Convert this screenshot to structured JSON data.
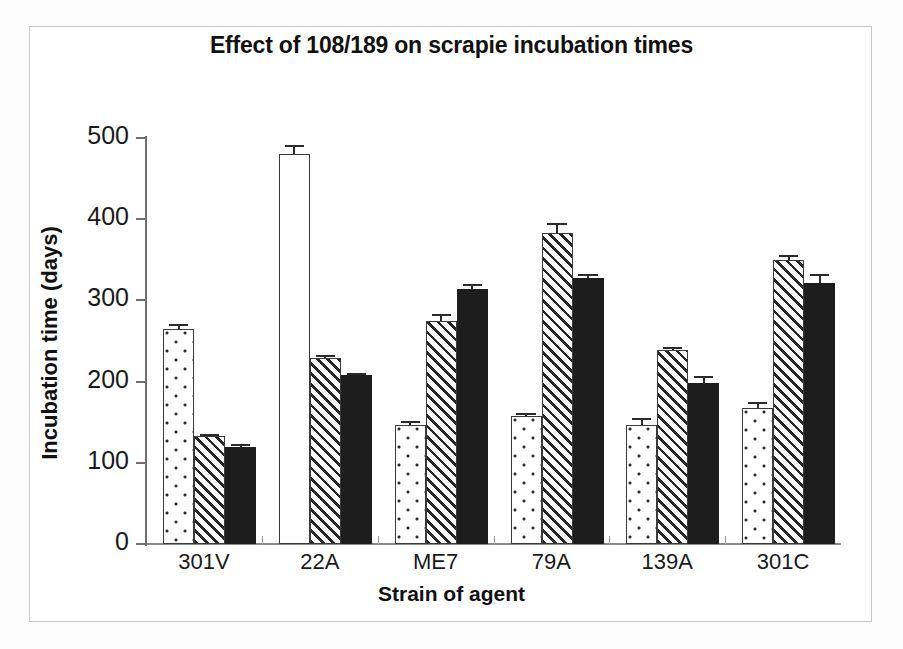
{
  "chart_data": {
    "type": "bar",
    "title": "Effect of 108/189 on scrapie incubation times",
    "xlabel": "Strain of agent",
    "ylabel": "Incubation time (days)",
    "ylim": [
      0,
      500
    ],
    "yticks": [
      0,
      100,
      200,
      300,
      400,
      500
    ],
    "grid": false,
    "legend": "none",
    "categories": [
      "301V",
      "22A",
      "ME7",
      "79A",
      "139A",
      "301C"
    ],
    "series": [
      {
        "name": "series-1",
        "pattern": "dotted",
        "values": [
          265,
          480,
          147,
          158,
          147,
          168
        ],
        "errors": [
          6,
          11,
          4,
          3,
          8,
          7
        ],
        "pattern_overrides": {
          "1": "blank"
        }
      },
      {
        "name": "series-2",
        "pattern": "hatch",
        "values": [
          133,
          229,
          275,
          383,
          239,
          350
        ],
        "errors": [
          3,
          4,
          8,
          12,
          4,
          6
        ]
      },
      {
        "name": "series-3",
        "pattern": "solid",
        "values": [
          120,
          208,
          314,
          328,
          198,
          321
        ],
        "errors": [
          3,
          3,
          6,
          5,
          9,
          12
        ]
      }
    ]
  },
  "axis": {
    "y_tick_labels": [
      "0",
      "100",
      "200",
      "300",
      "400",
      "500"
    ]
  }
}
